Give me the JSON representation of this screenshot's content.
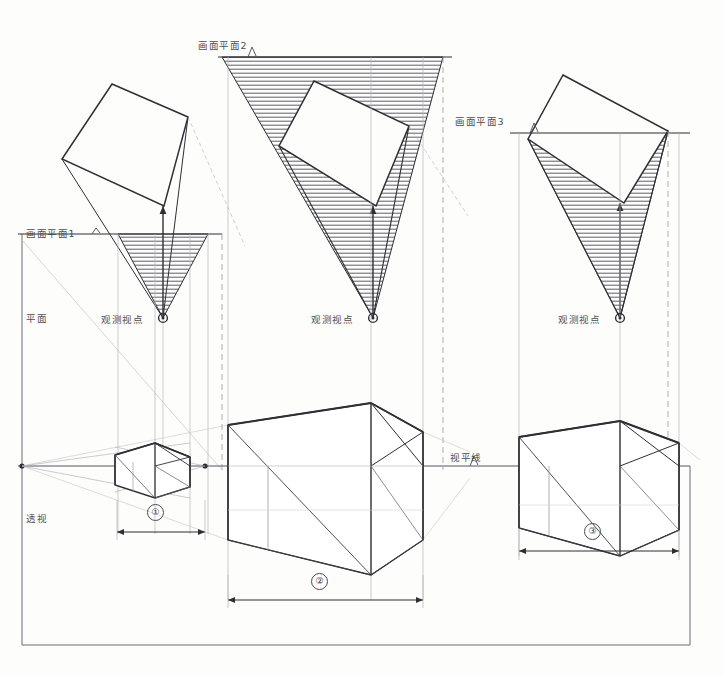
{
  "drawing": {
    "title_labels": {
      "plan_row": "平面",
      "perspective_row": "透视",
      "horizon_line": "视平线"
    },
    "picture_planes": [
      {
        "id": "pp1",
        "label": "画面平面1",
        "y": 234,
        "x_start": 18,
        "x_end": 222,
        "leader_x": 92,
        "leader_y": 228
      },
      {
        "id": "pp2",
        "label": "画面平面2",
        "y": 57,
        "x_start": 218,
        "x_end": 452,
        "leader_x": 248,
        "leader_y": 46
      },
      {
        "id": "pp3",
        "label": "画面平面3",
        "y": 133,
        "x_start": 510,
        "x_end": 690,
        "leader_x": 530,
        "leader_y": 122
      }
    ],
    "viewpoints": [
      {
        "id": "vp1",
        "label": "观测视点",
        "cx": 163,
        "cy": 318,
        "label_x": 101,
        "label_y": 312
      },
      {
        "id": "vp2",
        "label": "观测视点",
        "cx": 373,
        "cy": 318,
        "label_x": 311,
        "label_y": 312
      },
      {
        "id": "vp3",
        "label": "观测视点",
        "cx": 620,
        "cy": 318,
        "label_x": 558,
        "label_y": 312
      }
    ],
    "plan_rectangles": [
      {
        "id": "plan-rect-1",
        "points": "112,84 188,117 164,206 62,159"
      },
      {
        "id": "plan-rect-2",
        "points": "314,81 409,126 376,206 279,146"
      },
      {
        "id": "plan-rect-3",
        "points": "563,75 668,131 624,203 528,139"
      }
    ],
    "cones": [
      {
        "id": "cone-1",
        "apex_x": 163,
        "apex_y": 318,
        "left_x": 118,
        "right_x": 208,
        "plane_y": 234,
        "top_left_x": 62,
        "top_left_y": 159,
        "top_right_x": 188,
        "top_right_y": 117
      },
      {
        "id": "cone-2",
        "apex_x": 373,
        "apex_y": 318,
        "left_x": 222,
        "right_x": 443,
        "plane_y": 57,
        "top_left_x": 222,
        "top_left_y": 57,
        "top_right_x": 443,
        "top_right_y": 57
      },
      {
        "id": "cone-3",
        "apex_x": 620,
        "apex_y": 318,
        "left_x": 528,
        "right_x": 668,
        "plane_y": 133,
        "top_left_x": 528,
        "top_left_y": 139,
        "top_right_x": 668,
        "top_right_y": 131
      }
    ],
    "horizon": {
      "y": 466,
      "x_start": 18,
      "x_end": 690
    },
    "vanishing_points": [
      {
        "id": "vp-left-1",
        "x": 22,
        "y": 466
      },
      {
        "id": "vp-right-1",
        "x": 205,
        "y": 466
      }
    ],
    "perspective_boxes": [
      {
        "id": "persp-box-1",
        "top_front": "115,455 155,443 190,457",
        "front_vert_x": 155,
        "outline": "115,455 155,443 190,457 190,487 155,498 115,485",
        "note": "small left cube"
      },
      {
        "id": "persp-box-2",
        "outline": "228,425 371,403 423,432 423,540 371,575 228,540",
        "note": "large center box"
      },
      {
        "id": "persp-box-3",
        "outline": "519,437 620,421 679,443 679,530 620,556 519,528",
        "note": "right box"
      }
    ],
    "dimensions": [
      {
        "id": "dim-1",
        "number": "①",
        "x_start": 117,
        "x_end": 205,
        "y": 532,
        "label_x": 155,
        "label_y": 512
      },
      {
        "id": "dim-2",
        "number": "②",
        "x_start": 228,
        "x_end": 423,
        "y": 600,
        "label_x": 319,
        "label_y": 581
      },
      {
        "id": "dim-3",
        "number": "③",
        "x_start": 519,
        "x_end": 679,
        "y": 551,
        "label_x": 592,
        "label_y": 531
      }
    ],
    "frame": {
      "left": 22,
      "right": 690,
      "top": 234,
      "bottom": 645
    },
    "colors": {
      "line_dark": "#2e2e34",
      "line_medium": "#5b5b63",
      "line_light": "#a9a9b0",
      "hatch": "#4c4c54",
      "paper": "#fdfdfc"
    }
  }
}
